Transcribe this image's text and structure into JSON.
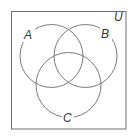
{
  "diagram": {
    "type": "venn",
    "universe": {
      "label": "U",
      "rect": {
        "x": 11.5,
        "y": 11.5,
        "w": 114.5,
        "h": 117.5
      }
    },
    "sets": [
      {
        "label": "A",
        "cx": 51.5,
        "cy": 56,
        "r": 31.5,
        "label_x": 29,
        "label_y": 39
      },
      {
        "label": "B",
        "cx": 85.5,
        "cy": 56,
        "r": 31.5,
        "label_x": 106,
        "label_y": 38
      },
      {
        "label": "C",
        "cx": 68.5,
        "cy": 85,
        "r": 32.5,
        "label_x": 68,
        "label_y": 122
      }
    ],
    "universe_label_x": 118,
    "universe_label_y": 21,
    "colors": {
      "stroke": "#7a7a7a",
      "border": "#6e6e6e",
      "text": "#333333",
      "background": "#ffffff"
    }
  }
}
